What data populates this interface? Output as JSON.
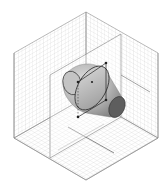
{
  "diagram": {
    "type": "isometric-3d-viewport",
    "colors": {
      "background": "#ffffff",
      "grid": "#c8c8c8",
      "edge": "#7a7a7a",
      "frame": "#333333",
      "cone_light": "#d6d6d6",
      "cone_mid": "#a9a9a9",
      "cone_dark": "#6e6e6e",
      "cap_dark": "#5a5a5a",
      "handle": "#222222"
    },
    "cube": {
      "top": [
        86,
        12
      ],
      "upper_right": [
        158,
        53
      ],
      "lower_right": [
        158,
        138
      ],
      "bottom": [
        86,
        180
      ],
      "lower_left": [
        14,
        138
      ],
      "upper_left": [
        14,
        53
      ],
      "back_corner": [
        86,
        97
      ]
    },
    "mid_plane": {
      "points": [
        [
          50,
          75
        ],
        [
          121,
          34
        ],
        [
          121,
          117
        ],
        [
          50,
          158
        ]
      ]
    },
    "floor_axes": [
      [
        [
          68,
          127
        ],
        [
          114,
          153
        ]
      ],
      [
        [
          86,
          138
        ],
        [
          86,
          138
        ]
      ]
    ],
    "object": {
      "name": "frustum",
      "back_cap": {
        "cx": 72,
        "cy": 83,
        "rx": 9,
        "ry": 12
      },
      "front_cap": {
        "cx": 117,
        "cy": 107,
        "rx": 8,
        "ry": 11
      },
      "large_ring": {
        "cx": 92,
        "cy": 88,
        "rx": 14,
        "ry": 24
      }
    },
    "selection_frame": {
      "points": [
        [
          78,
          82
        ],
        [
          106,
          63
        ],
        [
          106,
          100
        ],
        [
          78,
          117
        ]
      ],
      "handles": [
        [
          78,
          82
        ],
        [
          106,
          63
        ],
        [
          106,
          100
        ],
        [
          78,
          117
        ],
        [
          92,
          82
        ]
      ]
    }
  }
}
